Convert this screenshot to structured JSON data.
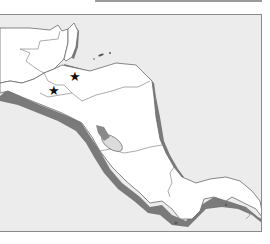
{
  "map": {
    "title": "",
    "region": "Central America",
    "colors": {
      "sea": "#ececec",
      "land": "#ffffff",
      "coast_shadow": "#7a7a7a",
      "border": "#8a8a8a",
      "lake": "#9a9a9a",
      "marker": "#111111"
    },
    "markers": [
      {
        "symbol": "★",
        "name": "star-marker-1",
        "x": 75,
        "y": 79
      },
      {
        "symbol": "★",
        "name": "star-marker-2",
        "x": 54,
        "y": 93
      }
    ]
  }
}
